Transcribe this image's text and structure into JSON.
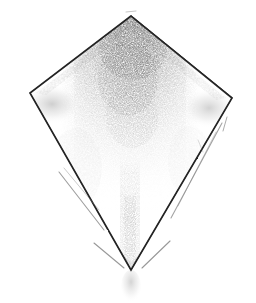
{
  "artwork": {
    "title": "Kite",
    "medium": "pencil sketch",
    "subject_icon": "kite-icon",
    "background_color": "#ffffff",
    "stroke_color": "#2b2b2b",
    "graphite_color": "#6e6e6e",
    "light_graphite_color": "#b8b8b8",
    "canvas": {
      "width": 256,
      "height": 303
    }
  },
  "shape": {
    "name": "kite-quadrilateral",
    "vertices": {
      "top": {
        "x": 131,
        "y": 16
      },
      "left": {
        "x": 30,
        "y": 93
      },
      "right": {
        "x": 232,
        "y": 98
      },
      "bottom": {
        "x": 131,
        "y": 270
      }
    },
    "outline_path": "M131,16 L30,93 L131,270 L232,98 Z"
  },
  "shading": {
    "upper_band": {
      "name": "central-graphite-band",
      "description": "dense vertical graphite shading below the top apex fading downward",
      "opacity": 0.72
    },
    "left_wing_smudge": {
      "name": "left-wing-smudge",
      "opacity": 0.3
    },
    "right_wing_smudge": {
      "name": "right-wing-smudge",
      "opacity": 0.3
    },
    "tail_trail": {
      "name": "kite-tail-trail",
      "opacity": 0.45
    },
    "bottom_smudge": {
      "name": "bottom-tail-smudge",
      "opacity": 0.28
    }
  },
  "accent_strokes": [
    {
      "name": "left-lower-guide-stroke-1",
      "path": "M59,172 L104,230"
    },
    {
      "name": "left-lower-guide-stroke-2",
      "path": "M64,168 L99,210"
    },
    {
      "name": "left-bottom-guide-stroke",
      "path": "M94,243 L124,268"
    },
    {
      "name": "right-lower-guide-stroke-1",
      "path": "M222,123 L171,218"
    },
    {
      "name": "right-lower-guide-stroke-2",
      "path": "M216,132 L178,206"
    },
    {
      "name": "right-bottom-guide-stroke",
      "path": "M170,241 L142,268"
    },
    {
      "name": "right-vertex-tick-stroke",
      "path": "M227,117 L223,131"
    },
    {
      "name": "apex-detached-tick",
      "path": "M126,12 L136,11"
    }
  ],
  "chart_data": {
    "type": "scatter",
    "title": "Kite",
    "xlabel": "",
    "ylabel": "",
    "categories": [
      "top",
      "left",
      "bottom",
      "right"
    ],
    "x": [
      131,
      30,
      131,
      232
    ],
    "y": [
      16,
      93,
      270,
      98
    ],
    "grid": false,
    "legend": "none"
  }
}
